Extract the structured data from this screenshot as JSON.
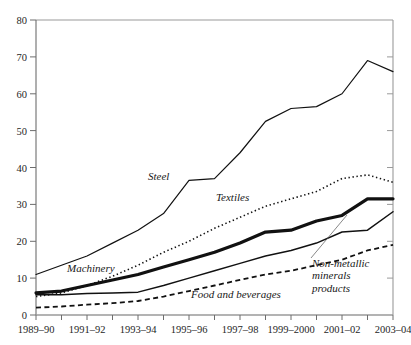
{
  "chart_data": {
    "type": "line",
    "title": "",
    "subtitle": "",
    "xlabel": "",
    "ylabel": "",
    "ylim": [
      0,
      80
    ],
    "yticks": [
      0,
      10,
      20,
      30,
      40,
      50,
      60,
      70,
      80
    ],
    "grid": false,
    "legend_position": "inline-annotations",
    "x": [
      "1989-90",
      "1990-91",
      "1991-92",
      "1992-93",
      "1993-94",
      "1994-95",
      "1995-96",
      "1996-97",
      "1997-98",
      "1998-99",
      "1999-2000",
      "2000-01",
      "2001-02",
      "2002-03",
      "2003-04"
    ],
    "xtick_labels": [
      "1989–90",
      "1991–92",
      "1993–94",
      "1995–96",
      "1997–98",
      "1999–2000",
      "2001–02",
      "2003–04"
    ],
    "series": [
      {
        "name": "Steel",
        "style": "solid-thin",
        "values": [
          11,
          13.5,
          16,
          19.5,
          23,
          27.5,
          36.5,
          37,
          44,
          52.5,
          56,
          56.5,
          60,
          69,
          66
        ]
      },
      {
        "name": "Textiles",
        "style": "dotted",
        "values": [
          5,
          6,
          8,
          10.5,
          13.5,
          17,
          20,
          23.5,
          26.5,
          29.5,
          31.5,
          33.5,
          37,
          38,
          36
        ]
      },
      {
        "name": "Machinery",
        "style": "solid-thick",
        "values": [
          6,
          6.5,
          8,
          9.5,
          11,
          13,
          15,
          17,
          19.5,
          22.5,
          23,
          25.5,
          27,
          31.5,
          31.5
        ]
      },
      {
        "name": "",
        "style": "solid-thin-lower",
        "values": [
          5.5,
          5.5,
          5.8,
          6,
          6.2,
          8,
          10,
          12,
          14,
          16,
          17.5,
          19.5,
          22.5,
          23,
          28
        ]
      },
      {
        "name": "Food and beverages",
        "style": "dashed",
        "values": [
          2,
          2.3,
          2.8,
          3.2,
          3.8,
          5,
          6.5,
          8,
          9.5,
          11,
          12,
          13.5,
          15,
          17.5,
          19
        ]
      }
    ],
    "annotations": [
      {
        "text": "Steel",
        "x_frac": 0.385,
        "y_frac": 0.517
      },
      {
        "text": "Textiles",
        "x_frac": 0.565,
        "y_frac": 0.585
      },
      {
        "text": "Machinery",
        "x_frac": 0.215,
        "y_frac": 0.787
      },
      {
        "text": "Food and beverages",
        "x_frac": 0.555,
        "y_frac": 0.868
      },
      {
        "text": "Non-metallic minerals products",
        "x_frac": 0.815,
        "y_frac": 0.79
      }
    ]
  },
  "axis": {
    "y_labels": [
      "80",
      "70",
      "60",
      "50",
      "40",
      "30",
      "20",
      "10",
      "0"
    ],
    "x_labels": [
      "1989–90",
      "1991–92",
      "1993–94",
      "1995–96",
      "1997–98",
      "1999–2000",
      "2001–02",
      "2003–04"
    ]
  },
  "labels": {
    "steel": "Steel",
    "textiles": "Textiles",
    "machinery": "Machinery",
    "food_and_beverages": "Food and beverages",
    "non_metallic_line1": "Non-metallic",
    "non_metallic_line2": "minerals",
    "non_metallic_line3": "products"
  },
  "colors": {
    "line": "#111111",
    "axis": "#8e8e8e",
    "text": "#222222",
    "background": "#ffffff"
  }
}
